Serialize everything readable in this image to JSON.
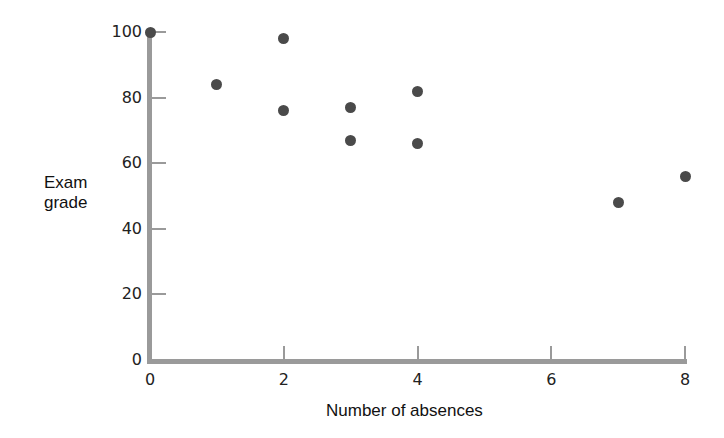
{
  "chart_data": {
    "type": "scatter",
    "title": "",
    "xlabel": "Number of absences",
    "ylabel": "Exam grade",
    "ylabel_lines": [
      "Exam",
      "grade"
    ],
    "xlim": [
      0,
      8
    ],
    "ylim": [
      0,
      100
    ],
    "xticks": [
      0,
      2,
      4,
      6,
      8
    ],
    "yticks": [
      0,
      20,
      40,
      60,
      80,
      100
    ],
    "grid": false,
    "legend": null,
    "series": [
      {
        "name": "Students",
        "color": "#4a4a4a",
        "points": [
          {
            "x": 0,
            "y": 100
          },
          {
            "x": 1,
            "y": 84
          },
          {
            "x": 2,
            "y": 98
          },
          {
            "x": 2,
            "y": 76
          },
          {
            "x": 3,
            "y": 77
          },
          {
            "x": 3,
            "y": 67
          },
          {
            "x": 4,
            "y": 82
          },
          {
            "x": 4,
            "y": 66
          },
          {
            "x": 7,
            "y": 48
          },
          {
            "x": 8,
            "y": 56
          }
        ]
      }
    ]
  },
  "axis_color": "#9a9a9a"
}
